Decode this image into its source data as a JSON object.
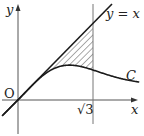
{
  "diagram": {
    "title": "",
    "axes": {
      "x_label": "x",
      "y_label": "y",
      "origin_label": "O"
    },
    "line": {
      "label": "y = x",
      "equation": "y = x"
    },
    "curve": {
      "label": "C"
    },
    "vertical_line": {
      "label": "√3",
      "x_value": "√3"
    },
    "shaded_region": {
      "description": "Region between line y = x and curve C, from x = 0 to x = √3",
      "pattern": "diagonal hatching"
    },
    "colors": {
      "stroke": "#222222",
      "hatch": "#444444",
      "background": "#ffffff"
    }
  }
}
